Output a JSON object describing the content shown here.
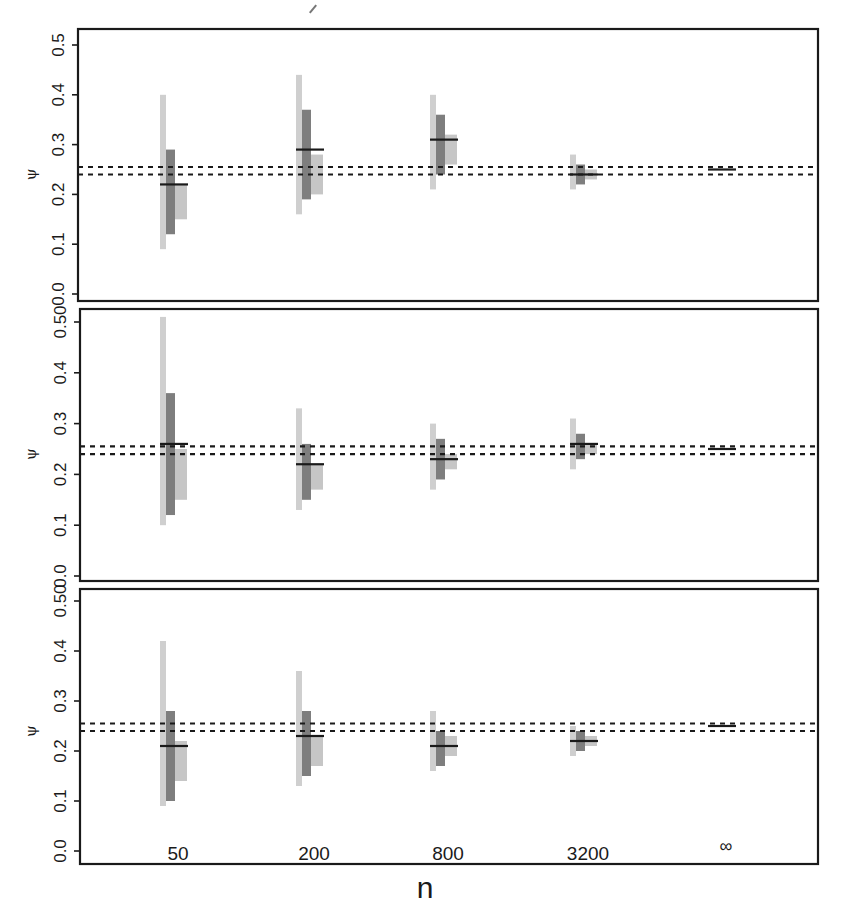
{
  "figure": {
    "x_axis_label": "n",
    "y_axis_label": "ψ",
    "colors": {
      "frame": "#1a1a1a",
      "light_bar": "#cfcfcf",
      "dark_bar": "#7e7e7e",
      "mid_bar": "#c6c6c6",
      "median_line": "#1a1a1a",
      "reference_lines": "#1a1a1a"
    }
  },
  "chart_data": [
    {
      "type": "bar",
      "panel": 1,
      "title": "",
      "xlabel": "",
      "ylabel": "ψ",
      "ylim": [
        0.0,
        0.5
      ],
      "yticks": [
        "0.0",
        "0.1",
        "0.2",
        "0.3",
        "0.4",
        "0.5"
      ],
      "categories": [
        "50",
        "200",
        "800",
        "3200",
        "∞"
      ],
      "reference_lines": [
        0.24,
        0.255
      ],
      "series": [
        {
          "name": "wide interval (light)",
          "low": [
            0.09,
            0.16,
            0.21,
            0.21,
            null
          ],
          "high": [
            0.4,
            0.44,
            0.4,
            0.28,
            null
          ]
        },
        {
          "name": "inner interval (dark)",
          "low": [
            0.12,
            0.19,
            0.24,
            0.22,
            null
          ],
          "high": [
            0.29,
            0.37,
            0.36,
            0.26,
            null
          ]
        },
        {
          "name": "side interval (light)",
          "low": [
            0.15,
            0.2,
            0.26,
            0.23,
            null
          ],
          "high": [
            0.22,
            0.28,
            0.32,
            0.25,
            null
          ]
        },
        {
          "name": "point estimate",
          "values": [
            0.22,
            0.29,
            0.31,
            0.24,
            0.25
          ]
        }
      ]
    },
    {
      "type": "bar",
      "panel": 2,
      "title": "",
      "xlabel": "",
      "ylabel": "ψ",
      "ylim": [
        0.0,
        0.5
      ],
      "yticks": [
        "0.0",
        "0.1",
        "0.2",
        "0.3",
        "0.4",
        "0.50"
      ],
      "categories": [
        "50",
        "200",
        "800",
        "3200",
        "∞"
      ],
      "reference_lines": [
        0.24,
        0.255
      ],
      "series": [
        {
          "name": "wide interval (light)",
          "low": [
            0.1,
            0.13,
            0.17,
            0.21,
            null
          ],
          "high": [
            0.51,
            0.33,
            0.3,
            0.31,
            null
          ]
        },
        {
          "name": "inner interval (dark)",
          "low": [
            0.12,
            0.15,
            0.19,
            0.23,
            null
          ],
          "high": [
            0.36,
            0.26,
            0.27,
            0.28,
            null
          ]
        },
        {
          "name": "side interval (light)",
          "low": [
            0.15,
            0.17,
            0.21,
            0.24,
            null
          ],
          "high": [
            0.25,
            0.22,
            0.24,
            0.26,
            null
          ]
        },
        {
          "name": "point estimate",
          "values": [
            0.26,
            0.22,
            0.23,
            0.26,
            0.25
          ]
        }
      ]
    },
    {
      "type": "bar",
      "panel": 3,
      "title": "",
      "xlabel": "n",
      "ylabel": "ψ",
      "ylim": [
        0.0,
        0.5
      ],
      "yticks": [
        "0.0",
        "0.1",
        "0.2",
        "0.3",
        "0.4",
        "0.50"
      ],
      "categories": [
        "50",
        "200",
        "800",
        "3200",
        "∞"
      ],
      "reference_lines": [
        0.24,
        0.255
      ],
      "series": [
        {
          "name": "wide interval (light)",
          "low": [
            0.09,
            0.13,
            0.16,
            0.19,
            null
          ],
          "high": [
            0.42,
            0.36,
            0.28,
            0.25,
            null
          ]
        },
        {
          "name": "inner interval (dark)",
          "low": [
            0.1,
            0.15,
            0.17,
            0.2,
            null
          ],
          "high": [
            0.28,
            0.28,
            0.24,
            0.24,
            null
          ]
        },
        {
          "name": "side interval (light)",
          "low": [
            0.14,
            0.17,
            0.19,
            0.21,
            null
          ],
          "high": [
            0.22,
            0.23,
            0.23,
            0.23,
            null
          ]
        },
        {
          "name": "point estimate",
          "values": [
            0.21,
            0.23,
            0.21,
            0.22,
            0.25
          ]
        }
      ]
    }
  ]
}
